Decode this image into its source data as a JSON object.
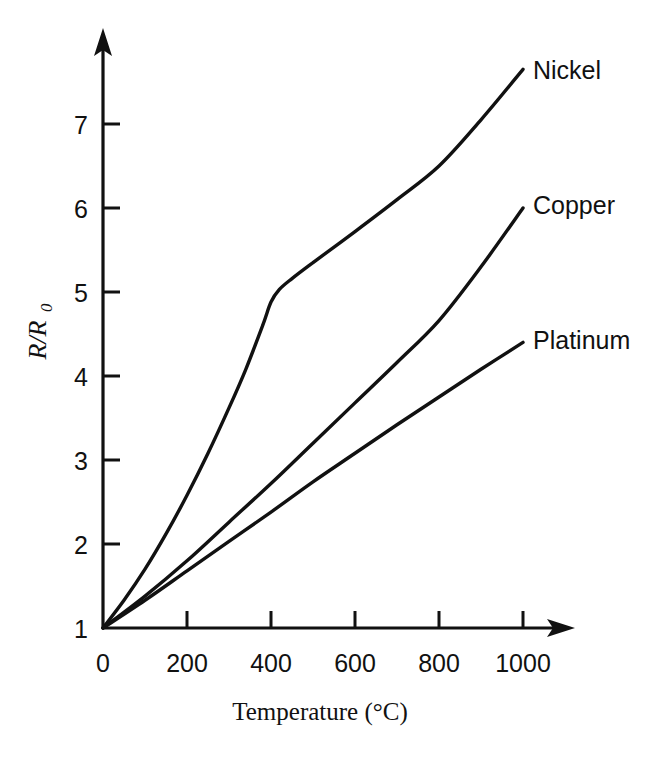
{
  "figure": {
    "background_color": "#ffffff",
    "ink_color": "#111111"
  },
  "chart_data": {
    "type": "line",
    "title": "",
    "subtitle": "",
    "xlabel": "Temperature (°C)",
    "ylabel": "R/R0",
    "ylabel_main": "R/R",
    "ylabel_subscript": "0",
    "xlim": [
      0,
      1100
    ],
    "ylim": [
      1,
      7.9
    ],
    "xticks": [
      0,
      200,
      400,
      600,
      800,
      1000
    ],
    "xtick_labels": [
      "0",
      "200",
      "400",
      "600",
      "800",
      "1000"
    ],
    "yticks": [
      1,
      2,
      3,
      4,
      5,
      6,
      7
    ],
    "ytick_labels": [
      "1",
      "2",
      "3",
      "4",
      "5",
      "6",
      "7"
    ],
    "grid": false,
    "legend_position": "inline-right-end-of-curve",
    "x_unit": "°C",
    "y_unit": "ratio",
    "axis_arrows": true,
    "tick_direction": "inward",
    "series": [
      {
        "name": "Nickel",
        "label": "Nickel",
        "color": "#111111",
        "x": [
          0,
          50,
          100,
          150,
          200,
          250,
          300,
          340,
          380,
          400,
          420,
          450,
          500,
          600,
          700,
          800,
          900,
          1000
        ],
        "values": [
          1.0,
          1.33,
          1.7,
          2.12,
          2.58,
          3.08,
          3.62,
          4.08,
          4.6,
          4.88,
          5.03,
          5.16,
          5.35,
          5.72,
          6.1,
          6.5,
          7.05,
          7.65
        ]
      },
      {
        "name": "Copper",
        "label": "Copper",
        "color": "#111111",
        "x": [
          0,
          100,
          200,
          300,
          400,
          500,
          600,
          700,
          800,
          900,
          1000
        ],
        "values": [
          1.0,
          1.38,
          1.8,
          2.26,
          2.72,
          3.2,
          3.68,
          4.16,
          4.66,
          5.3,
          6.0
        ]
      },
      {
        "name": "Platinum",
        "label": "Platinum",
        "color": "#111111",
        "x": [
          0,
          100,
          200,
          300,
          400,
          500,
          600,
          700,
          800,
          900,
          1000
        ],
        "values": [
          1.0,
          1.33,
          1.68,
          2.03,
          2.38,
          2.74,
          3.08,
          3.42,
          3.75,
          4.08,
          4.4
        ]
      }
    ]
  }
}
